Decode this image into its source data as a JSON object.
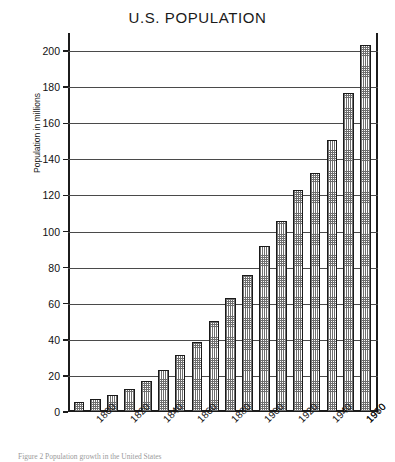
{
  "chart_data": {
    "type": "bar",
    "title": "U.S. POPULATION",
    "xlabel": "",
    "ylabel": "Population in millions",
    "ylim": [
      0,
      210
    ],
    "y_ticks": [
      0,
      20,
      40,
      60,
      80,
      100,
      120,
      140,
      160,
      180,
      200
    ],
    "grid": true,
    "legend": "none",
    "categories": [
      "1790",
      "1800",
      "1810",
      "1820",
      "1830",
      "1840",
      "1850",
      "1860",
      "1870",
      "1880",
      "1890",
      "1900",
      "1910",
      "1920",
      "1930",
      "1940",
      "1950",
      "1960",
      "1970"
    ],
    "visible_tick_labels": [
      "1800",
      "1820",
      "1840",
      "1860",
      "1880",
      "1900",
      "1920",
      "1940",
      "1960",
      "1970"
    ],
    "values": [
      5.3,
      7.2,
      9.6,
      12.9,
      17.1,
      23.2,
      31.4,
      38.6,
      50.2,
      62.9,
      76.0,
      92.0,
      105.7,
      122.8,
      132.2,
      150.7,
      177.0,
      203.2,
      203.2
    ],
    "bars": [
      {
        "year": "1790",
        "value": 5.3
      },
      {
        "year": "1800",
        "value": 7.2
      },
      {
        "year": "1810",
        "value": 9.6
      },
      {
        "year": "1820",
        "value": 12.9
      },
      {
        "year": "1830",
        "value": 17.1
      },
      {
        "year": "1840",
        "value": 23.2
      },
      {
        "year": "1850",
        "value": 31.4
      },
      {
        "year": "1860",
        "value": 38.6
      },
      {
        "year": "1870",
        "value": 50.2
      },
      {
        "year": "1880",
        "value": 62.9
      },
      {
        "year": "1890",
        "value": 76.0
      },
      {
        "year": "1900",
        "value": 92.0
      },
      {
        "year": "1910",
        "value": 105.7
      },
      {
        "year": "1920",
        "value": 122.8
      },
      {
        "year": "1930",
        "value": 132.2
      },
      {
        "year": "1940",
        "value": 150.7
      },
      {
        "year": "1950",
        "value": 177.0
      },
      {
        "year": "1960",
        "value": 203.2
      }
    ]
  },
  "caption": {
    "text": "Figure 2  Population growth in the United States"
  },
  "colors": {
    "axis": "#1c1c1c",
    "gridline": "#4a4a4a",
    "bar_outline": "#1a1a1a",
    "bar_fill": "#6e6e6e",
    "background": "#ffffff"
  }
}
